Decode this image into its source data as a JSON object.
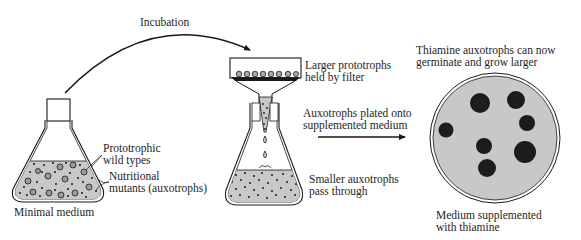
{
  "diagram": {
    "labels": {
      "incubation": "Incubation",
      "prototrophic_line1": "Prototrophic",
      "prototrophic_line2": "wild types",
      "nutritional_line1": "Nutritional",
      "nutritional_line2": "mutants (auxotrophs)",
      "minimal_medium": "Minimal medium",
      "larger_line1": "Larger prototrophs",
      "larger_line2": "held by filter",
      "plated_line1": "Auxotrophs plated onto",
      "plated_line2": "supplemented medium",
      "smaller_line1": "Smaller auxotrophs",
      "smaller_line2": "pass through",
      "thiamine_line1": "Thiamine auxotrophs can now",
      "thiamine_line2": "germinate and grow larger",
      "supplemented_line1": "Medium supplemented",
      "supplemented_line2": "with thiamine"
    },
    "colors": {
      "medium_fill": "#c8c8c8",
      "colony_fill": "#1c1c1c",
      "line": "#1a1a1a"
    },
    "colonies": [
      {
        "cx": 480,
        "cy": 103,
        "r": 10
      },
      {
        "cx": 516,
        "cy": 100,
        "r": 9
      },
      {
        "cx": 527,
        "cy": 123,
        "r": 8
      },
      {
        "cx": 446,
        "cy": 130,
        "r": 7
      },
      {
        "cx": 484,
        "cy": 146,
        "r": 8
      },
      {
        "cx": 525,
        "cy": 152,
        "r": 11
      },
      {
        "cx": 487,
        "cy": 169,
        "r": 9
      }
    ]
  }
}
